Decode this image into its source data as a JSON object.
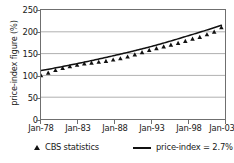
{
  "chart_data": {
    "type": "scatter",
    "title": "",
    "subtitle": "",
    "xlabel": "",
    "ylabel": "price-index figure (%)",
    "xlim": [
      1978,
      2003.5
    ],
    "ylim": [
      0,
      250
    ],
    "grid": "horizontal",
    "legend_position": "bottom",
    "y_ticks": [
      250,
      200,
      150,
      100,
      50,
      0
    ],
    "y_tick_labels": [
      "250",
      "200",
      "150",
      "100",
      "50",
      "0"
    ],
    "x_ticks": [
      1978,
      1983,
      1988,
      1993,
      1998,
      2003
    ],
    "x_tick_labels": [
      "Jan-78",
      "Jan-83",
      "Jan-88",
      "Jan-93",
      "Jan-98",
      "Jan-03"
    ],
    "series": [
      {
        "name": "CBS statistics",
        "type": "scatter",
        "marker": "triangle",
        "color": "#111111",
        "x": [
          1978,
          1979,
          1980,
          1981,
          1982,
          1983,
          1984,
          1985,
          1986,
          1987,
          1988,
          1989,
          1990,
          1991,
          1992,
          1993,
          1994,
          1995,
          1996,
          1997,
          1998,
          1999,
          2000,
          2001,
          2002,
          2003
        ],
        "values": [
          100,
          106,
          112,
          117,
          121,
          124,
          127,
          129,
          131,
          133,
          136,
          139,
          143,
          148,
          153,
          158,
          162,
          166,
          170,
          174,
          179,
          184,
          188,
          194,
          200,
          210
        ]
      },
      {
        "name": "price-index = 2.7%",
        "type": "line",
        "color": "#111111",
        "x": [
          1978,
          1983,
          1988,
          1993,
          1998,
          2003
        ],
        "values": [
          111,
          127,
          145,
          165,
          189,
          215
        ]
      }
    ],
    "legend": [
      {
        "label": "CBS statistics",
        "marker": "triangle"
      },
      {
        "label": "price-index = 2.7%",
        "marker": "line"
      }
    ]
  },
  "axes": {
    "y_title": "price-index figure (%)",
    "y_tick_labels": [
      "250",
      "200",
      "150",
      "100",
      "50",
      "0"
    ],
    "x_tick_labels": [
      "Jan-78",
      "Jan-83",
      "Jan-88",
      "Jan-93",
      "Jan-98",
      "Jan-03"
    ]
  },
  "legend": {
    "series_marker_label": "CBS statistics",
    "trend_line_label": "price-index = 2.7%"
  },
  "colors": {
    "ink": "#111111",
    "axis": "#6f6f6f",
    "grid": "#9a9a9a",
    "background": "#ffffff"
  }
}
